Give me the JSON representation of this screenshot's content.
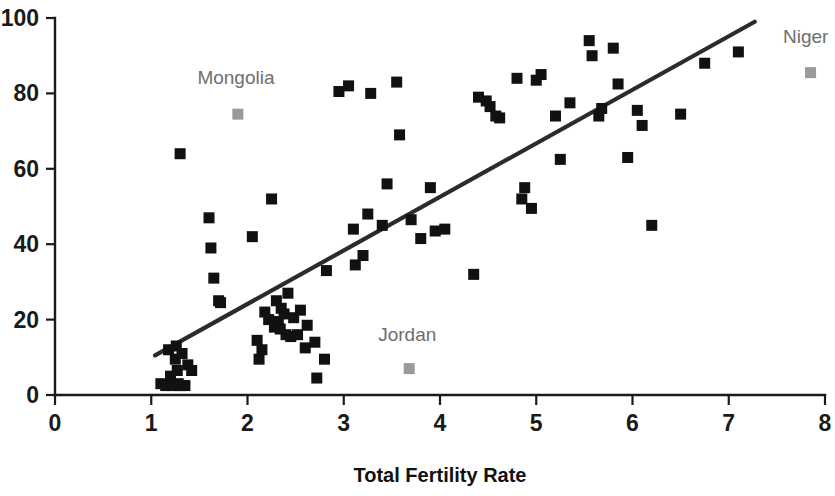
{
  "chart_data": {
    "type": "scatter",
    "title": "",
    "xlabel": "Total Fertility Rate",
    "ylabel": "",
    "xlim": [
      0,
      8
    ],
    "ylim": [
      0,
      100
    ],
    "xticks": [
      0,
      1,
      2,
      3,
      4,
      5,
      6,
      7,
      8
    ],
    "yticks": [
      0,
      20,
      40,
      60,
      80,
      100
    ],
    "xtick_labels": [
      "0",
      "1",
      "2",
      "3",
      "4",
      "5",
      "6",
      "7",
      "8"
    ],
    "ytick_labels": [
      "0",
      "20",
      "40",
      "60",
      "80",
      "100"
    ],
    "grid": false,
    "legend": false,
    "marker": "square",
    "series": [
      {
        "name": "countries",
        "color": "#111111",
        "points": [
          [
            1.1,
            3.0
          ],
          [
            1.15,
            2.5
          ],
          [
            1.18,
            12.0
          ],
          [
            1.2,
            5.0
          ],
          [
            1.22,
            2.5
          ],
          [
            1.25,
            9.5
          ],
          [
            1.26,
            13.0
          ],
          [
            1.27,
            6.5
          ],
          [
            1.28,
            3.0
          ],
          [
            1.3,
            2.5
          ],
          [
            1.3,
            64.0
          ],
          [
            1.32,
            11.0
          ],
          [
            1.35,
            2.5
          ],
          [
            1.38,
            8.0
          ],
          [
            1.42,
            6.5
          ],
          [
            1.6,
            47.0
          ],
          [
            1.62,
            39.0
          ],
          [
            1.65,
            31.0
          ],
          [
            1.7,
            25.0
          ],
          [
            1.72,
            24.5
          ],
          [
            2.05,
            42.0
          ],
          [
            2.1,
            14.5
          ],
          [
            2.12,
            9.5
          ],
          [
            2.15,
            12.0
          ],
          [
            2.18,
            22.0
          ],
          [
            2.22,
            20.0
          ],
          [
            2.25,
            52.0
          ],
          [
            2.28,
            18.0
          ],
          [
            2.3,
            25.0
          ],
          [
            2.32,
            19.5
          ],
          [
            2.34,
            17.5
          ],
          [
            2.35,
            23.0
          ],
          [
            2.38,
            21.5
          ],
          [
            2.4,
            16.0
          ],
          [
            2.42,
            27.0
          ],
          [
            2.45,
            15.5
          ],
          [
            2.48,
            20.5
          ],
          [
            2.52,
            16.0
          ],
          [
            2.55,
            22.5
          ],
          [
            2.6,
            12.5
          ],
          [
            2.62,
            18.5
          ],
          [
            2.7,
            14.0
          ],
          [
            2.72,
            4.5
          ],
          [
            2.8,
            9.5
          ],
          [
            2.82,
            33.0
          ],
          [
            2.95,
            80.5
          ],
          [
            3.05,
            82.0
          ],
          [
            3.1,
            44.0
          ],
          [
            3.12,
            34.5
          ],
          [
            3.2,
            37.0
          ],
          [
            3.25,
            48.0
          ],
          [
            3.28,
            80.0
          ],
          [
            3.4,
            45.0
          ],
          [
            3.45,
            56.0
          ],
          [
            3.55,
            83.0
          ],
          [
            3.58,
            69.0
          ],
          [
            3.7,
            46.5
          ],
          [
            3.8,
            41.5
          ],
          [
            3.9,
            55.0
          ],
          [
            3.95,
            43.5
          ],
          [
            4.05,
            44.0
          ],
          [
            4.35,
            32.0
          ],
          [
            4.4,
            79.0
          ],
          [
            4.48,
            78.0
          ],
          [
            4.52,
            76.5
          ],
          [
            4.58,
            74.0
          ],
          [
            4.62,
            73.5
          ],
          [
            4.8,
            84.0
          ],
          [
            4.85,
            52.0
          ],
          [
            4.88,
            55.0
          ],
          [
            4.95,
            49.5
          ],
          [
            5.0,
            83.5
          ],
          [
            5.05,
            85.0
          ],
          [
            5.2,
            74.0
          ],
          [
            5.25,
            62.5
          ],
          [
            5.35,
            77.5
          ],
          [
            5.55,
            94.0
          ],
          [
            5.58,
            90.0
          ],
          [
            5.65,
            74.0
          ],
          [
            5.68,
            76.0
          ],
          [
            5.8,
            92.0
          ],
          [
            5.85,
            82.5
          ],
          [
            5.95,
            63.0
          ],
          [
            6.05,
            75.5
          ],
          [
            6.1,
            71.5
          ],
          [
            6.2,
            45.0
          ],
          [
            6.5,
            74.5
          ],
          [
            6.75,
            88.0
          ],
          [
            7.1,
            91.0
          ]
        ]
      },
      {
        "name": "highlighted-countries",
        "color": "#9a9a9a",
        "points": [
          [
            1.9,
            74.5
          ],
          [
            3.68,
            7.0
          ],
          [
            7.85,
            85.5
          ]
        ]
      }
    ],
    "annotations": [
      {
        "text": "Mongolia",
        "x": 1.9,
        "y": 74.5,
        "label_x": 1.88,
        "label_y": 84.0
      },
      {
        "text": "Jordan",
        "x": 3.68,
        "y": 7.0,
        "label_x": 3.66,
        "label_y": 16.0
      },
      {
        "text": "Niger",
        "x": 7.85,
        "y": 85.5,
        "label_x": 7.8,
        "label_y": 95.0
      }
    ],
    "trendline": {
      "type": "linear-fit",
      "x_start": 1.04,
      "y_start": 10.5,
      "x_end": 7.27,
      "y_end": 99.0,
      "color": "#2b2b2b"
    }
  }
}
